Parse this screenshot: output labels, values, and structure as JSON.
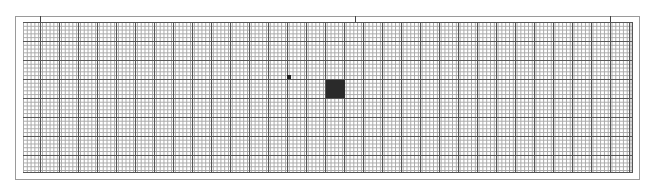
{
  "canvas": {
    "width": 652,
    "height": 188,
    "background": "#ffffff"
  },
  "grid": {
    "major_spacing_px": 19,
    "minor_subdivisions": 5,
    "major_line_color": "#555555",
    "minor_line_color": "#a8a8a8",
    "frame_color": "#9a9a9a"
  },
  "marks": [
    {
      "name": "small-dot",
      "x": 287,
      "y": 75,
      "w": 4,
      "h": 4,
      "color": "#222222"
    },
    {
      "name": "large-square",
      "x": 326,
      "y": 80,
      "w": 19,
      "h": 18,
      "color": "#2a2a2a"
    }
  ],
  "ticks": [
    {
      "name": "left-tick",
      "x": 40
    },
    {
      "name": "center-tick",
      "x": 355
    },
    {
      "name": "right-tick",
      "x": 610
    }
  ]
}
